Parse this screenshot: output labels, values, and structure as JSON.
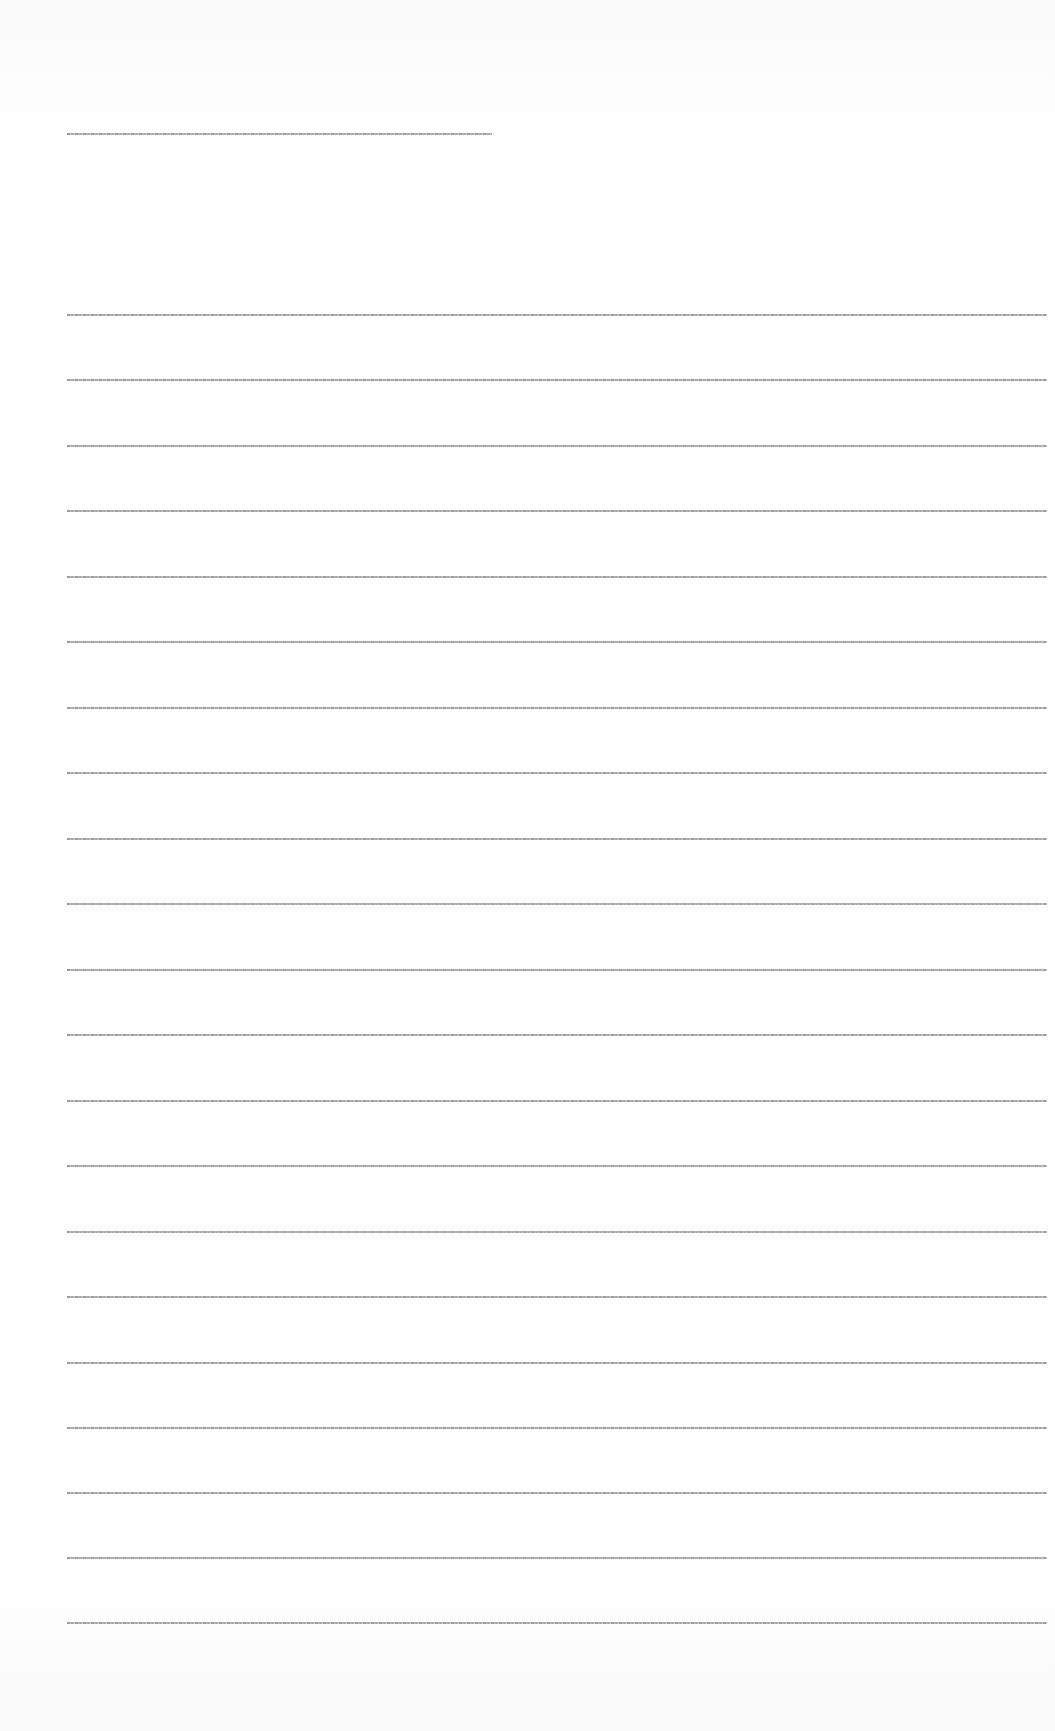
{
  "document": {
    "legibility": "text rendered too small to read at this resolution",
    "title_line": {
      "x": 67,
      "y": 133,
      "width": 425,
      "text": ""
    },
    "body_lines": [
      {
        "y": 314,
        "text": ""
      },
      {
        "y": 379,
        "text": ""
      },
      {
        "y": 445,
        "text": ""
      },
      {
        "y": 510,
        "text": ""
      },
      {
        "y": 576,
        "text": ""
      },
      {
        "y": 641,
        "text": ""
      },
      {
        "y": 707,
        "text": ""
      },
      {
        "y": 772,
        "text": ""
      },
      {
        "y": 838,
        "text": ""
      },
      {
        "y": 903,
        "text": ""
      },
      {
        "y": 969,
        "text": ""
      },
      {
        "y": 1034,
        "text": ""
      },
      {
        "y": 1100,
        "text": ""
      },
      {
        "y": 1165,
        "text": ""
      },
      {
        "y": 1231,
        "text": ""
      },
      {
        "y": 1296,
        "text": ""
      },
      {
        "y": 1362,
        "text": ""
      },
      {
        "y": 1427,
        "text": ""
      },
      {
        "y": 1492,
        "text": ""
      },
      {
        "y": 1557,
        "text": ""
      },
      {
        "y": 1622,
        "text": ""
      }
    ],
    "body_line_x": 67,
    "body_line_width": 980
  }
}
